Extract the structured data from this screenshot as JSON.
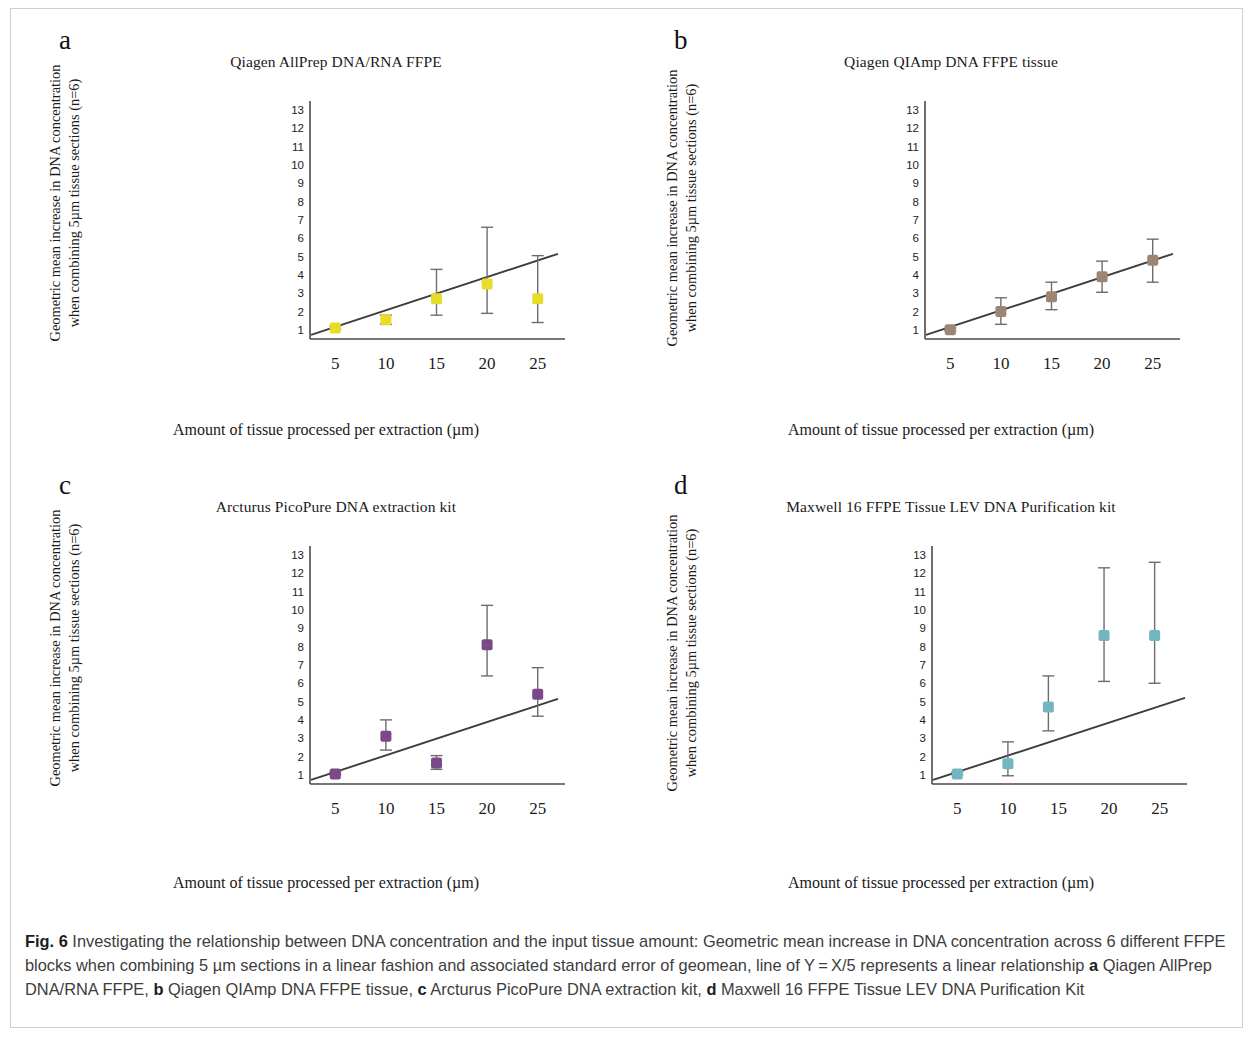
{
  "figure": {
    "caption_prefix": "Fig. 6",
    "caption_body_1": " Investigating the relationship between DNA concentration and the input tissue amount: Geometric mean increase in DNA concentration across 6 different FFPE blocks when combining 5 µm sections in a linear fashion and associated standard error of geomean, line of Y = X/5 represents a linear relationship ",
    "marker_a": "a",
    "caption_a": " Qiagen AllPrep DNA/RNA FFPE, ",
    "marker_b": "b",
    "caption_b": " Qiagen QIAmp DNA FFPE tissue, ",
    "marker_c": "c",
    "caption_c": " Arcturus PicoPure DNA extraction kit, ",
    "marker_d": "d",
    "caption_d": " Maxwell 16 FFPE Tissue LEV DNA Purification Kit"
  },
  "axes_common": {
    "xlabel": "Amount of tissue processed per extraction (µm)",
    "ylabel_line1": "Geometric mean increase in DNA concentration",
    "ylabel_line2": "when combining 5µm tissue sections (n=6)",
    "yticks": [
      "1",
      "2",
      "3",
      "4",
      "5",
      "6",
      "7",
      "8",
      "9",
      "10",
      "11",
      "12",
      "13"
    ],
    "xticks": [
      "5",
      "10",
      "15",
      "20",
      "25"
    ]
  },
  "chart_data": [
    {
      "panel": "a",
      "type": "scatter",
      "title": "Qiagen AllPrep DNA/RNA FFPE",
      "xlabel": "Amount of tissue processed per extraction (µm)",
      "ylabel": "Geometric mean increase in DNA concentration when combining 5µm tissue sections (n=6)",
      "xlim": [
        2.5,
        27.5
      ],
      "ylim": [
        0.5,
        13.6
      ],
      "grid": false,
      "legend": "none",
      "marker_color": "#e5dd2a",
      "marker_shape": "square",
      "x": [
        5,
        10,
        15,
        20,
        25
      ],
      "values": [
        1.1,
        1.55,
        2.7,
        3.5,
        2.7
      ],
      "err_low": [
        1.05,
        1.3,
        1.8,
        1.9,
        1.4
      ],
      "err_high": [
        1.2,
        1.8,
        4.3,
        6.6,
        5.05
      ],
      "fit_line": {
        "label": "Y = X/5",
        "x": [
          2.6,
          27.0
        ],
        "y": [
          0.72,
          5.15
        ]
      }
    },
    {
      "panel": "b",
      "type": "scatter",
      "title": "Qiagen QIAmp DNA FFPE tissue",
      "xlabel": "Amount of tissue processed per extraction (µm)",
      "ylabel": "Geometric mean increase in DNA concentration when combining 5µm tissue sections (n=6)",
      "xlim": [
        2.5,
        27.5
      ],
      "ylim": [
        0.5,
        13.6
      ],
      "grid": false,
      "legend": "none",
      "marker_color": "#9d8574",
      "marker_shape": "square",
      "x": [
        5,
        10,
        15,
        20,
        25
      ],
      "values": [
        1.0,
        2.0,
        2.8,
        3.9,
        4.8
      ],
      "err_low": [
        0.95,
        1.3,
        2.1,
        3.05,
        3.6
      ],
      "err_high": [
        1.1,
        2.75,
        3.6,
        4.75,
        5.95
      ],
      "fit_line": {
        "label": "Y = X/5",
        "x": [
          2.6,
          27.0
        ],
        "y": [
          0.72,
          5.15
        ]
      }
    },
    {
      "panel": "c",
      "type": "scatter",
      "title": "Arcturus PicoPure DNA extraction kit",
      "xlabel": "Amount of tissue processed per extraction (µm)",
      "ylabel": "Geometric mean increase in DNA concentration when combining 5µm tissue sections (n=6)",
      "xlim": [
        2.5,
        27.5
      ],
      "ylim": [
        0.5,
        13.6
      ],
      "grid": false,
      "legend": "none",
      "marker_color": "#7a4a88",
      "marker_shape": "square",
      "x": [
        5,
        10,
        15,
        20,
        25
      ],
      "values": [
        1.05,
        3.1,
        1.65,
        8.1,
        5.4
      ],
      "err_low": [
        1.0,
        2.35,
        1.3,
        6.4,
        4.2
      ],
      "err_high": [
        1.15,
        4.0,
        2.05,
        10.25,
        6.85
      ],
      "fit_line": {
        "label": "Y = X/5",
        "x": [
          2.6,
          27.0
        ],
        "y": [
          0.72,
          5.15
        ]
      }
    },
    {
      "panel": "d",
      "type": "scatter",
      "title": "Maxwell 16 FFPE Tissue LEV DNA Purification kit",
      "xlabel": "Amount of tissue processed per extraction (µm)",
      "ylabel": "Geometric mean increase in DNA concentration when combining 5µm tissue sections (n=6)",
      "xlim": [
        2.5,
        27.5
      ],
      "ylim": [
        0.5,
        13.6
      ],
      "grid": false,
      "legend": "none",
      "marker_color": "#74b5c2",
      "marker_shape": "square",
      "x": [
        5,
        10,
        14,
        19.5,
        24.5
      ],
      "values": [
        1.05,
        1.6,
        4.7,
        8.6,
        8.6
      ],
      "err_low": [
        1.0,
        0.95,
        3.4,
        6.1,
        6.0
      ],
      "err_high": [
        1.15,
        2.8,
        6.4,
        12.3,
        12.6
      ],
      "fit_line": {
        "label": "Y = X/5",
        "x": [
          2.6,
          27.5
        ],
        "y": [
          0.72,
          5.2
        ]
      }
    }
  ]
}
